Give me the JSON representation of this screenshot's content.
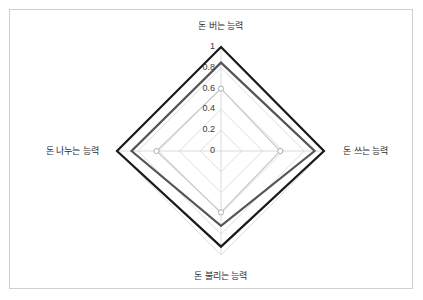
{
  "chart_data": {
    "type": "radar",
    "title": "",
    "categories": [
      "돈 버는 능력",
      "돈 쓰는 능력",
      "돈 불리는 능력",
      "돈 나누는 능력"
    ],
    "category_angles_deg": [
      90,
      0,
      270,
      180
    ],
    "rlim": [
      0,
      1
    ],
    "tick_values": [
      0,
      0.2,
      0.4,
      0.6,
      0.8,
      1
    ],
    "tick_labels": [
      "0",
      "0.2",
      "0.4",
      "0.6",
      "0.8",
      "1"
    ],
    "grid": true,
    "legend": "none",
    "series": [
      {
        "name": "series-1",
        "color": "#1a1a1a",
        "linewidth": 2.2,
        "values": [
          1.0,
          0.99,
          0.92,
          1.0
        ]
      },
      {
        "name": "series-2",
        "color": "#555555",
        "linewidth": 2.2,
        "values": [
          0.85,
          0.9,
          0.72,
          0.86
        ]
      },
      {
        "name": "series-3",
        "color": "#c9c9c9",
        "linewidth": 1.2,
        "values": [
          0.6,
          0.57,
          0.59,
          0.62
        ]
      }
    ],
    "markers": {
      "shape": "circle",
      "visible_on": "series-3",
      "facecolor": "#ffffff",
      "edgecolor": "#b0b0b0"
    },
    "axis_color": "#d0d0d0",
    "tick_label_color": "#3a3a3a",
    "label_color": "#2e2e2e",
    "background": "#ffffff",
    "frame_color": "#cfcfcf"
  },
  "geometry": {
    "cx": 221,
    "cy": 151,
    "r_max": 104
  }
}
